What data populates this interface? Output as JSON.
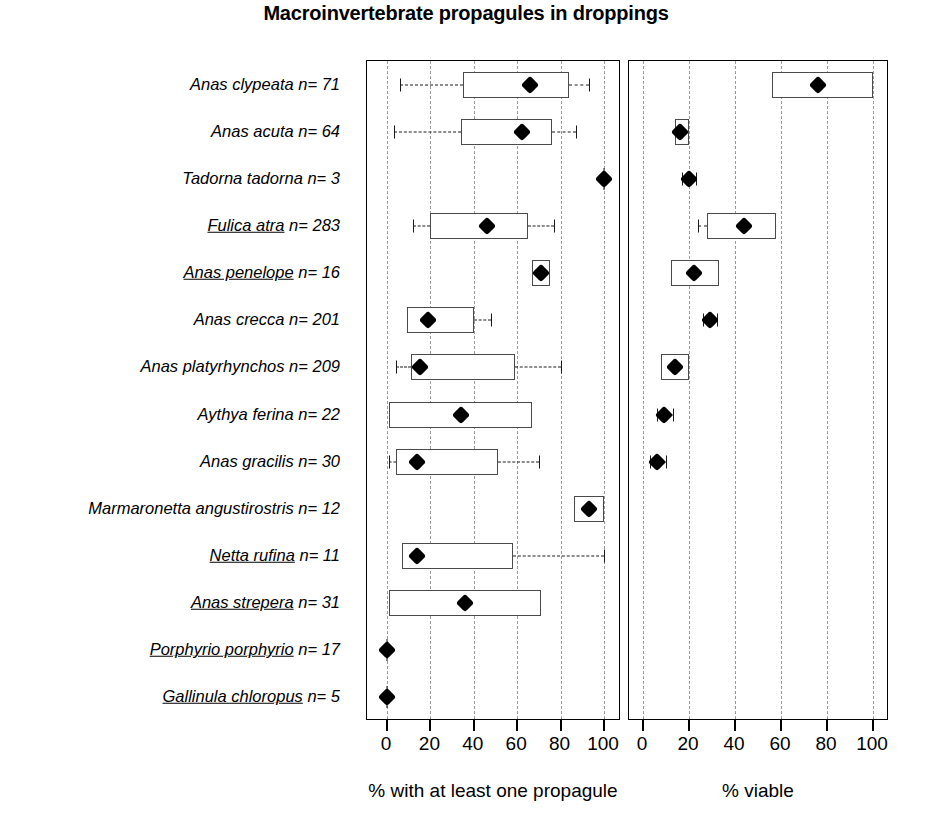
{
  "chart_data": {
    "type": "bar",
    "title": "Macroinvertebrate propagules in droppings",
    "panels": [
      {
        "key": "propagule",
        "xlabel": "% with at least one propagule",
        "xlim": [
          0,
          100
        ],
        "ticks": [
          0,
          20,
          40,
          60,
          80,
          100
        ],
        "grid": true
      },
      {
        "key": "viable",
        "xlabel": "% viable",
        "xlim": [
          0,
          100
        ],
        "ticks": [
          0,
          20,
          40,
          60,
          80,
          100
        ],
        "grid": true
      }
    ],
    "categories": [
      "Anas clypeata n= 71",
      "Anas acuta n= 64",
      "Tadorna tadorna n= 3",
      "Fulica atra n= 283",
      "Anas penelope  n= 16",
      "Anas crecca n= 201",
      "Anas platyrhynchos n= 209",
      "Aythya ferina  n= 22",
      "Anas gracilis n= 30",
      "Marmaronetta angustirostris n= 12",
      "Netta rufina n= 11",
      "Anas strepera n= 31",
      "Porphyrio porphyrio n= 17",
      "Gallinula chloropus  n= 5"
    ],
    "species_rows": [
      {
        "species": "Anas clypeata",
        "species_underlined": false,
        "n": 71,
        "label_species": "Anas clypeata",
        "label_n": " n= 71",
        "propagule": {
          "median": 66,
          "box_low": 35,
          "box_high": 84,
          "whisker_low": 6,
          "whisker_high": 93
        },
        "viable": {
          "median": 76,
          "box_low": 56,
          "box_high": 100,
          "whisker_low": null,
          "whisker_high": null
        }
      },
      {
        "species": "Anas acuta",
        "species_underlined": false,
        "n": 64,
        "label_species": "Anas acuta",
        "label_n": " n= 64",
        "propagule": {
          "median": 62,
          "box_low": 34,
          "box_high": 76,
          "whisker_low": 3,
          "whisker_high": 87
        },
        "viable": {
          "median": 16,
          "box_low": 14,
          "box_high": 20,
          "whisker_low": null,
          "whisker_high": null
        }
      },
      {
        "species": "Tadorna tadorna",
        "species_underlined": false,
        "n": 3,
        "label_species": "Tadorna tadorna",
        "label_n": " n= 3",
        "propagule": {
          "median": 100,
          "box_low": null,
          "box_high": null,
          "whisker_low": null,
          "whisker_high": null
        },
        "viable": {
          "median": 20,
          "box_low": null,
          "box_high": null,
          "whisker_low": 17,
          "whisker_high": 23
        }
      },
      {
        "species": "Fulica atra",
        "species_underlined": true,
        "n": 283,
        "label_species": "Fulica atra",
        "label_n": " n= 283",
        "propagule": {
          "median": 46,
          "box_low": 20,
          "box_high": 65,
          "whisker_low": 12,
          "whisker_high": 77
        },
        "viable": {
          "median": 44,
          "box_low": 28,
          "box_high": 58,
          "whisker_low": 24,
          "whisker_high": null
        }
      },
      {
        "species": "Anas penelope",
        "species_underlined": true,
        "n": 16,
        "label_species": "Anas penelope",
        "label_n": "  n= 16",
        "propagule": {
          "median": 71,
          "box_low": 67,
          "box_high": 75,
          "whisker_low": null,
          "whisker_high": null
        },
        "viable": {
          "median": 22,
          "box_low": 12,
          "box_high": 33,
          "whisker_low": null,
          "whisker_high": null
        }
      },
      {
        "species": "Anas crecca",
        "species_underlined": false,
        "n": 201,
        "label_species": "Anas crecca",
        "label_n": " n= 201",
        "propagule": {
          "median": 19,
          "box_low": 9,
          "box_high": 40,
          "whisker_low": null,
          "whisker_high": 48
        },
        "viable": {
          "median": 29,
          "box_low": null,
          "box_high": null,
          "whisker_low": 26,
          "whisker_high": 32
        }
      },
      {
        "species": "Anas platyrhynchos",
        "species_underlined": false,
        "n": 209,
        "label_species": "Anas platyrhynchos",
        "label_n": " n= 209",
        "propagule": {
          "median": 15,
          "box_low": 11,
          "box_high": 59,
          "whisker_low": 4,
          "whisker_high": 80
        },
        "viable": {
          "median": 14,
          "box_low": 8,
          "box_high": 20,
          "whisker_low": null,
          "whisker_high": null
        }
      },
      {
        "species": "Aythya ferina",
        "species_underlined": false,
        "n": 22,
        "label_species": "Aythya ferina",
        "label_n": "  n= 22",
        "propagule": {
          "median": 34,
          "box_low": 1,
          "box_high": 67,
          "whisker_low": null,
          "whisker_high": null
        },
        "viable": {
          "median": 9,
          "box_low": null,
          "box_high": null,
          "whisker_low": 6,
          "whisker_high": 13
        }
      },
      {
        "species": "Anas gracilis",
        "species_underlined": false,
        "n": 30,
        "label_species": "Anas gracilis",
        "label_n": " n= 30",
        "propagule": {
          "median": 14,
          "box_low": 4,
          "box_high": 51,
          "whisker_low": 1,
          "whisker_high": 70
        },
        "viable": {
          "median": 6,
          "box_low": null,
          "box_high": null,
          "whisker_low": 3,
          "whisker_high": 10
        }
      },
      {
        "species": "Marmaronetta angustirostris",
        "species_underlined": false,
        "n": 12,
        "label_species": "Marmaronetta angustirostris",
        "label_n": " n= 12",
        "propagule": {
          "median": 93,
          "box_low": 86,
          "box_high": 100,
          "whisker_low": null,
          "whisker_high": null
        },
        "viable": {
          "median": null,
          "box_low": null,
          "box_high": null,
          "whisker_low": null,
          "whisker_high": null
        }
      },
      {
        "species": "Netta rufina",
        "species_underlined": true,
        "n": 11,
        "label_species": "Netta rufina",
        "label_n": " n= 11",
        "propagule": {
          "median": 14,
          "box_low": 7,
          "box_high": 58,
          "whisker_low": null,
          "whisker_high": 100
        },
        "viable": {
          "median": null,
          "box_low": null,
          "box_high": null,
          "whisker_low": null,
          "whisker_high": null
        }
      },
      {
        "species": "Anas strepera",
        "species_underlined": true,
        "n": 31,
        "label_species": "Anas strepera",
        "label_n": " n= 31",
        "propagule": {
          "median": 36,
          "box_low": 1,
          "box_high": 71,
          "whisker_low": null,
          "whisker_high": null
        },
        "viable": {
          "median": null,
          "box_low": null,
          "box_high": null,
          "whisker_low": null,
          "whisker_high": null
        }
      },
      {
        "species": "Porphyrio porphyrio",
        "species_underlined": true,
        "n": 17,
        "label_species": "Porphyrio porphyrio",
        "label_n": " n= 17",
        "propagule": {
          "median": 0,
          "box_low": null,
          "box_high": null,
          "whisker_low": null,
          "whisker_high": null
        },
        "viable": {
          "median": null,
          "box_low": null,
          "box_high": null,
          "whisker_low": null,
          "whisker_high": null
        }
      },
      {
        "species": "Gallinula chloropus",
        "species_underlined": true,
        "n": 5,
        "label_species": "Gallinula chloropus",
        "label_n": "  n= 5",
        "propagule": {
          "median": 0,
          "box_low": null,
          "box_high": null,
          "whisker_low": null,
          "whisker_high": null
        },
        "viable": {
          "median": null,
          "box_low": null,
          "box_high": null,
          "whisker_low": null,
          "whisker_high": null
        }
      }
    ]
  },
  "colors": {
    "marker": "#000000",
    "box_stroke": "#4a4a4a",
    "grid": "#9a9a9a",
    "frame": "#000000",
    "background": "#ffffff"
  }
}
